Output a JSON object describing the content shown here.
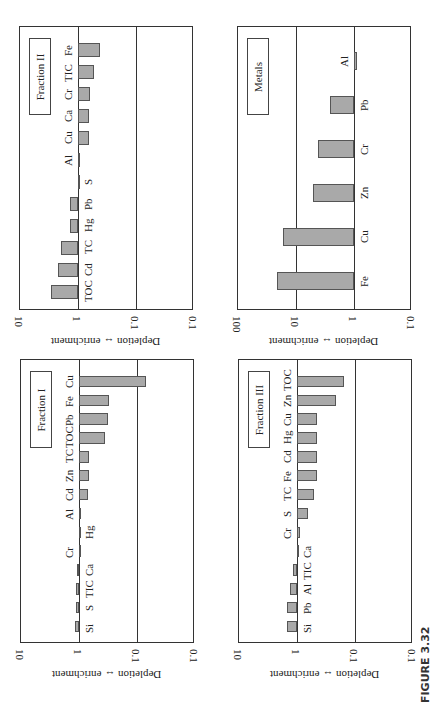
{
  "figure_caption": "FIGURE 3.32",
  "axis_label": "Depletion ↔ enrichment",
  "chart_data": [
    {
      "type": "bar",
      "title": "Fraction II",
      "orientation": "rotated 90deg, log scale",
      "ylabel": "Depletion ↔ enrichment",
      "yscale": "log",
      "ylim": [
        0.01,
        10
      ],
      "tick_labels": [
        "10",
        "1",
        "0.1",
        "0.1"
      ],
      "categories": [
        "TOC",
        "Cd",
        "TC",
        "Hg",
        "Pb",
        "S",
        "Al",
        "Cu",
        "Ca",
        "Cr",
        "TIC",
        "Fe"
      ],
      "values": [
        2.9,
        2.2,
        2.0,
        1.4,
        1.4,
        1.0,
        0.93,
        0.65,
        0.65,
        0.62,
        0.52,
        0.42
      ]
    },
    {
      "type": "bar",
      "title": "Metals",
      "orientation": "rotated 90deg, log scale",
      "ylabel": "Depletion ↔ enrichment",
      "yscale": "log",
      "ylim": [
        0.1,
        100
      ],
      "tick_labels": [
        "100",
        "10",
        "1",
        "0.1"
      ],
      "categories": [
        "Fe",
        "Cu",
        "Zn",
        "Cr",
        "Pb",
        "Al"
      ],
      "values": [
        21,
        17,
        5.0,
        4.2,
        2.6,
        0.9
      ]
    },
    {
      "type": "bar",
      "title": "Fraction I",
      "orientation": "rotated 90deg, log scale",
      "ylabel": "Depletion ↔ enrichment",
      "yscale": "log",
      "ylim": [
        0.01,
        10
      ],
      "tick_labels": [
        "10",
        "1",
        "0.1",
        "0.1"
      ],
      "categories": [
        "Si",
        "S",
        "TIC",
        "Ca",
        "Cr",
        "Hg",
        "Al",
        "Cd",
        "Zn",
        "TC",
        "TOC",
        "Pb",
        "Fe",
        "Cu"
      ],
      "values": [
        1.15,
        1.12,
        1.12,
        1.1,
        0.98,
        1.0,
        0.93,
        0.7,
        0.67,
        0.67,
        0.35,
        0.32,
        0.31,
        0.07
      ]
    },
    {
      "type": "bar",
      "title": "Fraction III",
      "orientation": "rotated 90deg, log scale",
      "ylabel": "Depletion ↔ enrichment",
      "yscale": "log",
      "ylim": [
        0.01,
        10
      ],
      "tick_labels": [
        "10",
        "1",
        "0.1",
        "0.1"
      ],
      "categories": [
        "Si",
        "Pb",
        "Al",
        "TIC",
        "Ca",
        "Cr",
        "S",
        "TC",
        "Fe",
        "Cd",
        "Hg",
        "Cu",
        "Zn",
        "TOC"
      ],
      "values": [
        1.5,
        1.5,
        1.3,
        1.15,
        1.02,
        0.9,
        0.65,
        0.5,
        0.46,
        0.46,
        0.46,
        0.46,
        0.21,
        0.156
      ]
    }
  ]
}
